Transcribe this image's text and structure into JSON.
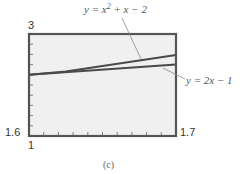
{
  "chart_data": {
    "type": "line",
    "title": "",
    "caption": "(c)",
    "xlabel": "",
    "ylabel": "",
    "xlim": [
      1.6,
      1.7
    ],
    "ylim": [
      1,
      3
    ],
    "grid": false,
    "x_tick_count": 10,
    "y_tick_count": 10,
    "tick_labels": {
      "y_max": "3",
      "y_min": "1",
      "x_min": "1.6",
      "x_max": "1.7"
    },
    "series": [
      {
        "name": "y = x^2 + x - 2",
        "label_text": "y = x",
        "label_exp": "2",
        "label_rest": " + x − 2",
        "x": [
          1.6,
          1.625,
          1.65,
          1.675,
          1.7
        ],
        "values": [
          2.2,
          2.266,
          2.3725,
          2.4806,
          2.59
        ]
      },
      {
        "name": "y = 2x - 1",
        "label_text": "y = 2x − 1",
        "x": [
          1.6,
          1.7
        ],
        "values": [
          2.2,
          2.4
        ]
      }
    ],
    "annotations": [
      {
        "text": "y = x^2 + x - 2",
        "position": "top, leader line to upper curve"
      },
      {
        "text": "y = 2x - 1",
        "position": "right, leader line to lower line"
      }
    ],
    "colors": {
      "frame": "#555555",
      "plot_bg": "#f0f0f0",
      "curve": "#4a4a4a",
      "leader": "#888888"
    }
  }
}
